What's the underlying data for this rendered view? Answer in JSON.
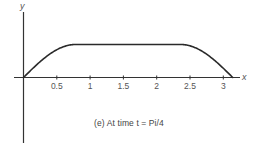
{
  "chart_data": {
    "type": "line",
    "title": "",
    "caption": "(e) At time t = Pi/4",
    "xlabel": "x",
    "ylabel": "y",
    "xlim": [
      0,
      3.3
    ],
    "ylim": [
      -1,
      1.2
    ],
    "grid": false,
    "legend": null,
    "x_ticks": [
      0.5,
      1,
      1.5,
      2,
      2.5,
      3
    ],
    "x_tick_labels": [
      "0.5",
      "1",
      "1.5",
      "2",
      "2.5",
      "3"
    ],
    "series": [
      {
        "name": "u(x, t=Pi/4)",
        "description": "Rises like sin(2x) from 0 to 1 on [0, Pi/4], constant 1 on [Pi/4, 3Pi/4], falls like sin(2x) back to 0 on [3Pi/4, Pi]",
        "x": [
          0,
          0.1,
          0.2,
          0.3,
          0.4,
          0.5,
          0.6,
          0.7,
          0.785,
          1.0,
          1.5,
          2.0,
          2.356,
          2.45,
          2.55,
          2.65,
          2.75,
          2.85,
          2.95,
          3.05,
          3.1416
        ],
        "y": [
          0,
          0.2,
          0.39,
          0.56,
          0.72,
          0.84,
          0.93,
          0.99,
          1,
          1,
          1,
          1,
          1,
          0.98,
          0.92,
          0.83,
          0.7,
          0.55,
          0.37,
          0.18,
          0
        ],
        "color": "#2a2a2a"
      }
    ]
  },
  "figure": {
    "caption": "(e) At time t = Pi/4",
    "axis_x_label": "x",
    "axis_y_label": "y",
    "tick_labels": [
      "0.5",
      "1",
      "1.5",
      "2",
      "2.5",
      "3"
    ]
  }
}
